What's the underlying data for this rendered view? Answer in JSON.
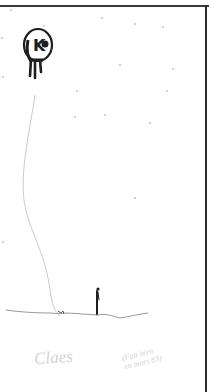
{
  "artwork": {
    "description": "Pencil sketch of a small figure holding a long string to a dripping round kite-like balloon in a starry sky",
    "colors": {
      "background": "#ffffff",
      "ink": "#1e1e1e",
      "pencil": "#bdbdbd",
      "signature": "#d2d2d2"
    },
    "balloon_glyph": "K",
    "signature": {
      "left": "Claes",
      "right_line1": "(Fait bien",
      "right_line2": "en mars 83)"
    }
  }
}
